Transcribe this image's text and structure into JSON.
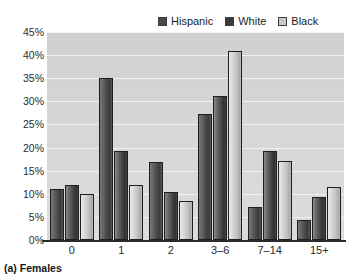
{
  "caption": "(a) Females",
  "legend": {
    "position": "top-right",
    "entries": [
      {
        "label": "Hispanic",
        "color": "#4a4a4a",
        "key": "hispanic"
      },
      {
        "label": "White",
        "color": "#3a3a3a",
        "key": "white"
      },
      {
        "label": "Black",
        "color": "#c8c8c8",
        "key": "black"
      }
    ]
  },
  "chart_data": {
    "type": "bar",
    "title": "",
    "subtitle": "",
    "xlabel": "",
    "ylabel": "",
    "categories": [
      "0",
      "1",
      "2",
      "3–6",
      "7–14",
      "15+"
    ],
    "series": [
      {
        "name": "Hispanic",
        "values": [
          11.0,
          35.0,
          16.8,
          27.2,
          7.2,
          4.3
        ]
      },
      {
        "name": "White",
        "values": [
          12.0,
          19.2,
          10.3,
          31.2,
          19.3,
          9.3
        ]
      },
      {
        "name": "Black",
        "values": [
          10.0,
          12.0,
          8.5,
          41.0,
          17.1,
          11.4
        ]
      }
    ],
    "ylim": [
      0,
      45
    ],
    "ytick_values": [
      0,
      5,
      10,
      15,
      20,
      25,
      30,
      35,
      40,
      45
    ],
    "ytick_labels": [
      "0%",
      "5%",
      "10%",
      "15%",
      "20%",
      "25%",
      "30%",
      "35%",
      "40%",
      "45%"
    ],
    "grid": true,
    "grid_axis": "y",
    "legend_position": "top-right",
    "plot_background": "#d6d6d6",
    "gridline_color": "#f2f2f2"
  }
}
